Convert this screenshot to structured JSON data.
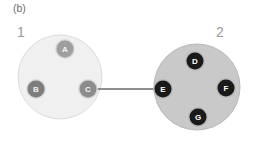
{
  "figure": {
    "panel_label": "(b)",
    "background_color": "#ffffff",
    "width": 254,
    "height": 141
  },
  "clusters": [
    {
      "id": "cluster-1",
      "label": "1",
      "label_color": "#9a9a9a",
      "cx": 60,
      "cy": 77,
      "r": 42,
      "fill": "#f0f0f0",
      "stroke": "#dcdcdc"
    },
    {
      "id": "cluster-2",
      "label": "2",
      "label_color": "#9a9a9a",
      "cx": 197,
      "cy": 87,
      "r": 43,
      "fill": "#c9c9c9",
      "stroke": "#b8b8b8"
    }
  ],
  "nodes": [
    {
      "id": "node-a",
      "label": "A",
      "cx": 65,
      "cy": 49,
      "r": 8.5,
      "fill": "#9e9e9e",
      "ring": "#d8d8d8",
      "text_color": "#f2f2f2",
      "cluster": "cluster-1"
    },
    {
      "id": "node-b",
      "label": "B",
      "cx": 36,
      "cy": 89,
      "r": 8.5,
      "fill": "#7d7d7d",
      "ring": "#d8d8d8",
      "text_color": "#f2f2f2",
      "cluster": "cluster-1"
    },
    {
      "id": "node-c",
      "label": "C",
      "cx": 88,
      "cy": 89,
      "r": 8.5,
      "fill": "#8c8c8c",
      "ring": "#d8d8d8",
      "text_color": "#f2f2f2",
      "cluster": "cluster-1"
    },
    {
      "id": "node-d",
      "label": "D",
      "cx": 195,
      "cy": 61,
      "r": 8.5,
      "fill": "#1a1a1a",
      "ring": "#b8b8b8",
      "text_color": "#ffffff",
      "cluster": "cluster-2"
    },
    {
      "id": "node-e",
      "label": "E",
      "cx": 163,
      "cy": 89,
      "r": 8.5,
      "fill": "#1a1a1a",
      "ring": "#b8b8b8",
      "text_color": "#ffffff",
      "cluster": "cluster-2"
    },
    {
      "id": "node-f",
      "label": "F",
      "cx": 226,
      "cy": 88,
      "r": 8.5,
      "fill": "#1a1a1a",
      "ring": "#b8b8b8",
      "text_color": "#ffffff",
      "cluster": "cluster-2"
    },
    {
      "id": "node-g",
      "label": "G",
      "cx": 198,
      "cy": 117,
      "r": 8.5,
      "fill": "#1a1a1a",
      "ring": "#b8b8b8",
      "text_color": "#ffffff",
      "cluster": "cluster-2"
    }
  ],
  "edges": [
    {
      "id": "edge-c-e",
      "from": "node-c",
      "to": "node-e",
      "x1": 88,
      "y1": 89,
      "x2": 163,
      "y2": 89,
      "color": "#6b6b6b",
      "width": 1.4
    }
  ]
}
